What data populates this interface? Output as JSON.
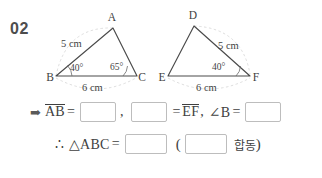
{
  "question": {
    "number": "02"
  },
  "figure": {
    "triangle_left": {
      "name": "triangle-abc",
      "vertices": [
        {
          "label": "A",
          "x": 113,
          "y": 28
        },
        {
          "label": "B",
          "x": 56,
          "y": 76
        },
        {
          "label": "C",
          "x": 137,
          "y": 76
        }
      ],
      "side_labels": [
        {
          "text": "5 cm",
          "x": 62,
          "y": 45,
          "side": "BA"
        },
        {
          "text": "6 cm",
          "x": 82,
          "y": 88,
          "side": "BC"
        }
      ],
      "angles": [
        {
          "text": "40°",
          "vertex": "B",
          "x": 70,
          "y": 69
        },
        {
          "text": "65°",
          "vertex": "C",
          "x": 114,
          "y": 68
        }
      ]
    },
    "triangle_right": {
      "name": "triangle-def",
      "vertices": [
        {
          "label": "D",
          "x": 194,
          "y": 26
        },
        {
          "label": "E",
          "x": 168,
          "y": 76
        },
        {
          "label": "F",
          "x": 250,
          "y": 76
        }
      ],
      "side_labels": [
        {
          "text": "5 cm",
          "x": 218,
          "y": 45,
          "side": "DF"
        },
        {
          "text": "6 cm",
          "x": 196,
          "y": 88,
          "side": "EF"
        }
      ],
      "angles": [
        {
          "text": "40°",
          "vertex": "F",
          "x": 222,
          "y": 69
        }
      ]
    }
  },
  "answers": {
    "line1": {
      "arrow": "➡",
      "term_ab": "AB",
      "blank1_value": "",
      "comma": ",",
      "blank2_value": "",
      "equals": "=",
      "term_ef": "EF",
      "separator": ",",
      "angle_b": "∠B",
      "blank3_value": ""
    },
    "line2": {
      "therefore": "∴",
      "triangle_abc": "△ABC",
      "equals": "=",
      "blank4_value": "",
      "open_paren": "(",
      "blank5_value": "",
      "congruence_label": "합동",
      "close_paren": ")"
    }
  },
  "colors": {
    "ink": "#3f3f3f",
    "number": "#4d4d4d",
    "stroke": "#4a4a4a",
    "guide": "#c9c9c9",
    "box_border": "#bdbdbd",
    "background": "#ffffff"
  }
}
